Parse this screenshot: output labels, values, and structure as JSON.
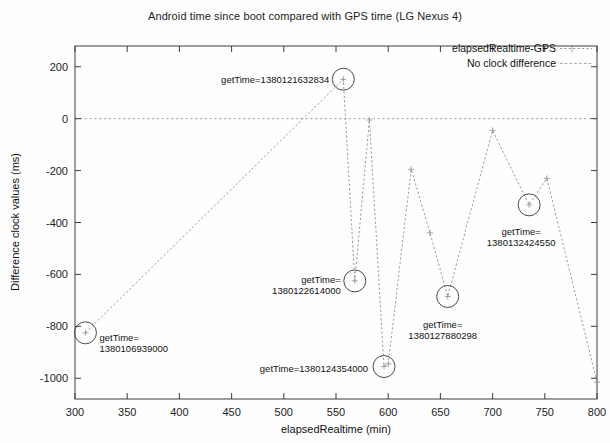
{
  "chart_data": {
    "type": "line",
    "title": "Android time since boot compared with GPS time (LG Nexus 4)",
    "xlabel": "elapsedRealtime (min)",
    "ylabel": "Difference clock values (ms)",
    "xlim": [
      300,
      800
    ],
    "ylim": [
      -1080,
      280
    ],
    "xticks": [
      300,
      350,
      400,
      450,
      500,
      550,
      600,
      650,
      700,
      750,
      800
    ],
    "yticks": [
      200,
      0,
      -200,
      -400,
      -600,
      -800,
      -1000
    ],
    "grid": false,
    "legend_position": "top-right",
    "legend": [
      {
        "name": "elapsedRealtime-GPS",
        "style": "dotted-line-with-plus-marker"
      },
      {
        "name": "No clock difference",
        "style": "dotted-line"
      }
    ],
    "reference_line": {
      "name": "No clock difference",
      "y": 0
    },
    "series": [
      {
        "name": "elapsedRealtime-GPS",
        "x": [
          310,
          557,
          568,
          582,
          596,
          600,
          622,
          640,
          657,
          700,
          735,
          752,
          800
        ],
        "y": [
          -825,
          152,
          -625,
          -5,
          -955,
          -945,
          -195,
          -440,
          -685,
          -45,
          -332,
          -230,
          -1015
        ]
      }
    ],
    "annotations": [
      {
        "label_line1": "getTime=",
        "label_line2": "1380106939000",
        "x": 310,
        "y": -825
      },
      {
        "label_line1": "getTime=1380121632834",
        "label_line2": "",
        "x": 557,
        "y": 152
      },
      {
        "label_line1": "getTime=",
        "label_line2": "1380122614000",
        "x": 568,
        "y": -625
      },
      {
        "label_line1": "getTime=1380124354000",
        "label_line2": "",
        "x": 596,
        "y": -955
      },
      {
        "label_line1": "getTime=",
        "label_line2": "1380127880298",
        "x": 657,
        "y": -685
      },
      {
        "label_line1": "getTime=",
        "label_line2": "1380132424550",
        "x": 735,
        "y": -332
      }
    ]
  },
  "labels": {
    "title": "Android time since boot compared with GPS time (LG Nexus 4)",
    "xlabel": "elapsedRealtime (min)",
    "ylabel": "Difference clock values (ms)",
    "legend_1": "elapsedRealtime-GPS",
    "legend_2": "No clock difference",
    "ytick_200": "200",
    "ytick_0": "0",
    "ytick_m200": "-200",
    "ytick_m400": "-400",
    "ytick_m600": "-600",
    "ytick_m800": "-800",
    "ytick_m1000": "-1000",
    "xtick_300": "300",
    "xtick_350": "350",
    "xtick_400": "400",
    "xtick_450": "450",
    "xtick_500": "500",
    "xtick_550": "550",
    "xtick_600": "600",
    "xtick_650": "650",
    "xtick_700": "700",
    "xtick_750": "750",
    "xtick_800": "800",
    "annot_1_l1": "getTime=",
    "annot_1_l2": "1380106939000",
    "annot_2_l1": "getTime=1380121632834",
    "annot_3_l1": "getTime=",
    "annot_3_l2": "1380122614000",
    "annot_4_l1": "getTime=1380124354000",
    "annot_5_l1": "getTime=",
    "annot_5_l2": "1380127880298",
    "annot_6_l1": "getTime=",
    "annot_6_l2": "1380132424550"
  }
}
